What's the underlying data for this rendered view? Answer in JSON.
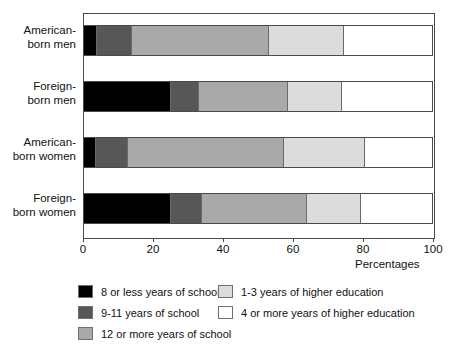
{
  "chart_data": {
    "type": "bar",
    "orientation": "horizontal",
    "stacked": true,
    "title": "",
    "xlabel": "Percentages",
    "ylabel": "",
    "xlim": [
      0,
      100
    ],
    "xticks": [
      0,
      20,
      40,
      60,
      80,
      100
    ],
    "grid": false,
    "legend_position": "bottom",
    "categories": [
      "American-born men",
      "Foreign-born men",
      "American-born women",
      "Foreign-born women"
    ],
    "series": [
      {
        "name": "8 or less years of school",
        "color": "#000000",
        "values": [
          4,
          25,
          3.7,
          25
        ]
      },
      {
        "name": "9-11 years of school",
        "color": "#575757",
        "values": [
          10,
          8,
          9.3,
          9
        ]
      },
      {
        "name": "12 or more years of school",
        "color": "#a9a9a9",
        "values": [
          39,
          25.5,
          44.5,
          30
        ]
      },
      {
        "name": "1-3 years of higher education",
        "color": "#dcdcdc",
        "values": [
          21.5,
          15.5,
          23,
          15.5
        ]
      },
      {
        "name": "4 or more years of higher education",
        "color": "#ffffff",
        "values": [
          25.5,
          26,
          19.5,
          20.5
        ]
      }
    ]
  },
  "axis": {
    "tick_labels": [
      "0",
      "20",
      "40",
      "60",
      "80",
      "100"
    ],
    "title": "Percentages"
  },
  "legend": {
    "left_column": [
      {
        "label": "8 or less years of school",
        "color": "#000000"
      },
      {
        "label": "9-11 years of school",
        "color": "#575757"
      },
      {
        "label": "12 or more years of school",
        "color": "#a9a9a9"
      }
    ],
    "right_column": [
      {
        "label": "1-3 years of higher education",
        "color": "#dcdcdc"
      },
      {
        "label": "4 or more years of higher education",
        "color": "#ffffff"
      }
    ]
  },
  "category_labels": [
    {
      "line1": "American-",
      "line2": "born men"
    },
    {
      "line1": "Foreign-",
      "line2": "born men"
    },
    {
      "line1": "American-",
      "line2": "born women"
    },
    {
      "line1": "Foreign-",
      "line2": "born women"
    }
  ]
}
